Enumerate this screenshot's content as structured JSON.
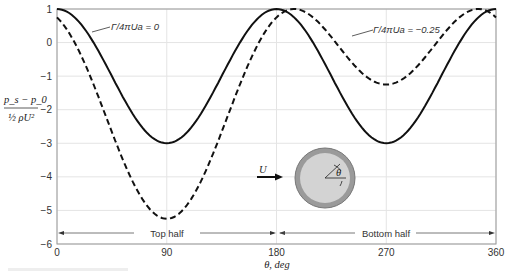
{
  "chart_data": {
    "type": "line",
    "title": "",
    "xlabel": "θ, deg",
    "ylabel": "(p_s − p_0) / (½ ρU²)",
    "xlim": [
      0,
      360
    ],
    "ylim": [
      -6,
      1
    ],
    "xticks": [
      0,
      90,
      180,
      270,
      360
    ],
    "yticks": [
      1,
      0,
      -1,
      -2,
      -3,
      -4,
      -5,
      -6
    ],
    "grid": true,
    "x": [
      0,
      15,
      30,
      45,
      60,
      75,
      90,
      105,
      120,
      135,
      150,
      165,
      180,
      195,
      210,
      225,
      240,
      255,
      270,
      285,
      300,
      315,
      330,
      345,
      360
    ],
    "series": [
      {
        "name": "Γ/4πUa = 0",
        "style": "solid",
        "values": [
          1.0,
          0.73,
          0.0,
          -1.0,
          -2.0,
          -2.73,
          -3.0,
          -2.73,
          -2.0,
          -1.0,
          0.0,
          0.73,
          1.0,
          0.73,
          0.0,
          -1.0,
          -2.0,
          -2.73,
          -3.0,
          -2.73,
          -2.0,
          -1.0,
          0.0,
          0.73,
          1.0
        ]
      },
      {
        "name": "Γ/4πUa = −0.25",
        "style": "dashed",
        "values": [
          0.75,
          0.21,
          -1.0,
          -2.54,
          -3.98,
          -4.92,
          -5.25,
          -4.92,
          -3.98,
          -2.54,
          -1.0,
          0.21,
          0.75,
          0.98,
          1.0,
          0.9,
          0.73,
          0.52,
          -1.25,
          0.52,
          0.73,
          0.9,
          1.0,
          0.98,
          0.75
        ]
      }
    ],
    "annotations": [
      {
        "text": "Γ/4πUa = 0",
        "target_series": 0
      },
      {
        "text": "Γ/4πUa = −0.25",
        "target_series": 1
      },
      {
        "text": "Top half",
        "range": [
          0,
          180
        ]
      },
      {
        "text": "Bottom half",
        "range": [
          180,
          360
        ]
      }
    ],
    "inset": {
      "type": "cylinder-diagram",
      "labels": [
        "U",
        "θ"
      ]
    }
  },
  "axes": {
    "xlabel": "θ, deg",
    "ylabel_num": "p_s − p_0",
    "ylabel_den": "½ ρU²",
    "xticks": [
      "0",
      "90",
      "180",
      "270",
      "360"
    ],
    "yticks": [
      "1",
      "0",
      "−1",
      "−2",
      "−3",
      "−4",
      "−5",
      "−6"
    ]
  },
  "labels": {
    "series0": "Γ/4πUa = 0",
    "series1": "Γ/4πUa = −0.25",
    "top_half": "Top half",
    "bottom_half": "Bottom half",
    "inset_u": "U",
    "inset_theta": "θ"
  }
}
